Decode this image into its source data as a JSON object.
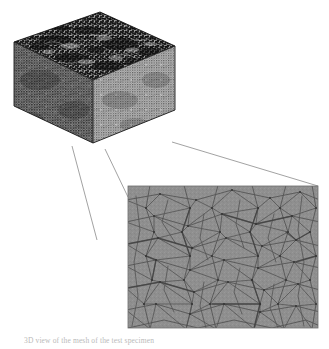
{
  "figure": {
    "title_alt": "3D tetrahedral mesh of a cubic test specimen with magnified surface detail",
    "caption": "3D view of the mesh of the test specimen",
    "background_color": "#ffffff",
    "cube": {
      "label": "mesh-cube",
      "description": "Dense unstructured tetrahedral finite element mesh rendered as a cube in isometric view",
      "top_face_color": "#2a2a2a",
      "front_face_color": "#565656",
      "right_face_color": "#767676",
      "edge_color": "#1a1a1a",
      "apex": {
        "x": 100,
        "y": 12
      },
      "left": {
        "x": 14,
        "y": 42
      },
      "right": {
        "x": 175,
        "y": 46
      },
      "bottom": {
        "x": 93,
        "y": 143
      }
    },
    "detail_panel": {
      "label": "magnified-mesh-detail",
      "description": "Close-up of the surface triangulation of the mesh",
      "fill_color": "#8b8b8b",
      "line_color": "#4a4a4a",
      "border_color": "#6f6f6f",
      "x": 128,
      "y": 186,
      "width": 190,
      "height": 142
    },
    "leader_lines": {
      "label": "callout-leader-lines",
      "color": "#8a8a8a",
      "count": 3,
      "segments": [
        {
          "x1": 72,
          "y1": 146,
          "x2": 97,
          "y2": 238
        },
        {
          "x1": 104,
          "y1": 148,
          "x2": 128,
          "y2": 196
        },
        {
          "x1": 172,
          "y1": 142,
          "x2": 318,
          "y2": 186
        }
      ]
    }
  }
}
